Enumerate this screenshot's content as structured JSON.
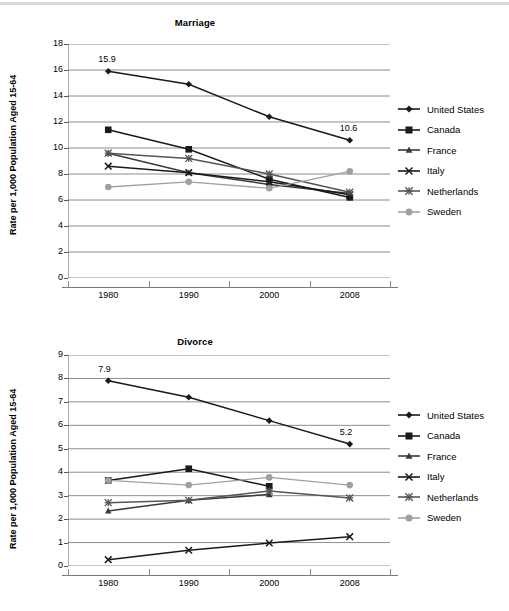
{
  "figure": {
    "background": "#ffffff",
    "top_rule_color": "#d8d8d8"
  },
  "charts": [
    {
      "id": "marriage",
      "title": "Marriage",
      "ylabel": "Rate per 1,000 Population Aged 15-64",
      "xticks": [
        "1980",
        "1990",
        "2000",
        "2008"
      ],
      "yticks": [
        "0",
        "2",
        "4",
        "6",
        "8",
        "10",
        "12",
        "14",
        "16",
        "18"
      ],
      "annotations": [
        {
          "text": "15.9",
          "x": "1980",
          "y": 15.9
        },
        {
          "text": "10.6",
          "x": "2008",
          "y": 10.6
        }
      ],
      "legend": [
        {
          "label": "United States",
          "marker": "diamond",
          "color": "#1a1a1a"
        },
        {
          "label": "Canada",
          "marker": "square",
          "color": "#1a1a1a"
        },
        {
          "label": "France",
          "marker": "triangle",
          "color": "#3a3a3a"
        },
        {
          "label": "Italy",
          "marker": "x",
          "color": "#1a1a1a"
        },
        {
          "label": "Netherlands",
          "marker": "asterisk",
          "color": "#555555"
        },
        {
          "label": "Sweden",
          "marker": "circle",
          "color": "#a0a0a0"
        }
      ]
    },
    {
      "id": "divorce",
      "title": "Divorce",
      "ylabel": "Rate per 1,000 Population Aged 15-64",
      "xticks": [
        "1980",
        "1990",
        "2000",
        "2008"
      ],
      "yticks": [
        "0",
        "1",
        "2",
        "3",
        "4",
        "5",
        "6",
        "7",
        "8",
        "9"
      ],
      "annotations": [
        {
          "text": "7.9",
          "x": "1980",
          "y": 7.9
        },
        {
          "text": "5.2",
          "x": "2008",
          "y": 5.2
        }
      ],
      "legend": [
        {
          "label": "United States",
          "marker": "diamond",
          "color": "#1a1a1a"
        },
        {
          "label": "Canada",
          "marker": "square",
          "color": "#1a1a1a"
        },
        {
          "label": "France",
          "marker": "triangle",
          "color": "#3a3a3a"
        },
        {
          "label": "Italy",
          "marker": "x",
          "color": "#1a1a1a"
        },
        {
          "label": "Netherlands",
          "marker": "asterisk",
          "color": "#555555"
        },
        {
          "label": "Sweden",
          "marker": "circle",
          "color": "#a0a0a0"
        }
      ]
    }
  ],
  "chart_data": [
    {
      "type": "line",
      "title": "Marriage",
      "xlabel": "",
      "ylabel": "Rate per 1,000 Population Aged 15-64",
      "categories": [
        "1980",
        "1990",
        "2000",
        "2008"
      ],
      "ylim": [
        0,
        18
      ],
      "ytick_step": 2,
      "grid": true,
      "legend_position": "right",
      "data_labels": {
        "1980": 15.9,
        "2008": 10.6
      },
      "series": [
        {
          "name": "United States",
          "marker": "diamond",
          "color": "#1a1a1a",
          "values": [
            15.9,
            14.9,
            12.4,
            10.6
          ]
        },
        {
          "name": "Canada",
          "marker": "square",
          "color": "#1a1a1a",
          "values": [
            11.4,
            9.9,
            7.6,
            6.2
          ]
        },
        {
          "name": "France",
          "marker": "triangle",
          "color": "#3a3a3a",
          "values": [
            9.6,
            8.1,
            7.2,
            6.5
          ]
        },
        {
          "name": "Italy",
          "marker": "x",
          "color": "#1a1a1a",
          "values": [
            8.6,
            8.1,
            7.4,
            6.4
          ]
        },
        {
          "name": "Netherlands",
          "marker": "asterisk",
          "color": "#555555",
          "values": [
            9.6,
            9.2,
            8.0,
            6.6
          ]
        },
        {
          "name": "Sweden",
          "marker": "circle",
          "color": "#a0a0a0",
          "values": [
            7.0,
            7.4,
            6.9,
            8.2
          ]
        }
      ]
    },
    {
      "type": "line",
      "title": "Divorce",
      "xlabel": "",
      "ylabel": "Rate per 1,000 Population Aged 15-64",
      "categories": [
        "1980",
        "1990",
        "2000",
        "2008"
      ],
      "ylim": [
        0,
        9
      ],
      "ytick_step": 1,
      "grid": true,
      "legend_position": "right",
      "data_labels": {
        "1980": 7.9,
        "2008": 5.2
      },
      "series": [
        {
          "name": "United States",
          "marker": "diamond",
          "color": "#1a1a1a",
          "values": [
            7.9,
            7.2,
            6.2,
            5.2
          ]
        },
        {
          "name": "Canada",
          "marker": "square",
          "color": "#1a1a1a",
          "values": [
            3.65,
            4.15,
            3.4,
            null
          ]
        },
        {
          "name": "France",
          "marker": "triangle",
          "color": "#3a3a3a",
          "values": [
            2.35,
            2.8,
            3.05,
            null
          ]
        },
        {
          "name": "Italy",
          "marker": "x",
          "color": "#1a1a1a",
          "values": [
            0.27,
            0.67,
            0.98,
            1.25
          ]
        },
        {
          "name": "Netherlands",
          "marker": "asterisk",
          "color": "#555555",
          "values": [
            2.7,
            2.8,
            3.2,
            2.9
          ]
        },
        {
          "name": "Sweden",
          "marker": "circle",
          "color": "#a0a0a0",
          "values": [
            3.65,
            3.45,
            3.78,
            3.45
          ]
        }
      ]
    }
  ]
}
